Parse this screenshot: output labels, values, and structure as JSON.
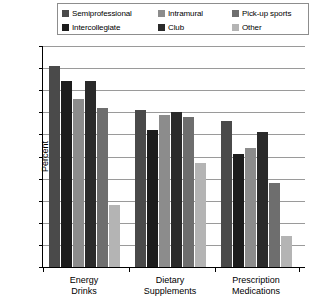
{
  "chart_data": {
    "type": "bar",
    "title": "",
    "xlabel": "",
    "ylabel": "Percent",
    "ylim": [
      0,
      100
    ],
    "yticks": [
      0,
      10,
      20,
      30,
      40,
      50,
      60,
      70,
      80,
      90,
      100
    ],
    "grid": true,
    "legend_position": "top",
    "categories": [
      "Energy Drinks",
      "Dietary Supplements",
      "Prescription Medications"
    ],
    "category_lines": [
      [
        "Energy",
        "Drinks"
      ],
      [
        "Dietary",
        "Supplements"
      ],
      [
        "Prescription",
        "Medications"
      ]
    ],
    "series": [
      {
        "name": "Semiprofessional",
        "color": "#4a4a4a",
        "values": [
          91,
          71,
          66
        ]
      },
      {
        "name": "Intercollegiate",
        "color": "#1c1c1c",
        "values": [
          84,
          62,
          51
        ]
      },
      {
        "name": "Intramural",
        "color": "#8c8c8c",
        "values": [
          76,
          69,
          54
        ]
      },
      {
        "name": "Club",
        "color": "#2a2a2a",
        "values": [
          84,
          70,
          61
        ]
      },
      {
        "name": "Pick-up sports",
        "color": "#6e6e6e",
        "values": [
          72,
          68,
          38
        ]
      },
      {
        "name": "Other",
        "color": "#b4b4b4",
        "values": [
          28,
          47,
          14
        ]
      }
    ]
  },
  "legend": {
    "rows": [
      [
        {
          "label": "Semiprofessional",
          "color": "#4a4a4a"
        },
        {
          "label": "Intramural",
          "color": "#8c8c8c"
        },
        {
          "label": "Pick-up sports",
          "color": "#6e6e6e"
        }
      ],
      [
        {
          "label": "Intercollegiate",
          "color": "#1c1c1c"
        },
        {
          "label": "Club",
          "color": "#2a2a2a"
        },
        {
          "label": "Other",
          "color": "#b4b4b4"
        }
      ]
    ]
  }
}
